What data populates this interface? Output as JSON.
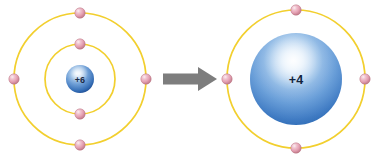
{
  "figure": {
    "type": "atomic-model-transformation-diagram",
    "background_color": "#ffffff",
    "width": 382,
    "height": 157
  },
  "palette": {
    "orbit_ring": "#f2cf2e",
    "orbit_ring_shadow": "#d9b41f",
    "electron_fill": "#e8a8b8",
    "electron_highlight": "#f7e2e8",
    "electron_edge": "#b8707f",
    "nucleus_blue_light": "#e8f2fb",
    "nucleus_blue_mid": "#5f96d4",
    "nucleus_blue_dark": "#1f5fae",
    "arrow_color": "#7d7d7d",
    "label_text": "#1b2a44"
  },
  "atoms": [
    {
      "id": "atom-left",
      "name": "carbon-atom-neutral",
      "nucleus": {
        "label": "+6",
        "charge": 6,
        "radius": 14,
        "center_x": 80,
        "center_y": 79
      },
      "shell_count": 2,
      "shells": [
        {
          "index": 1,
          "name": "inner-shell",
          "radius": 35,
          "electron_count": 2,
          "electron_angles_deg": [
            270,
            90
          ]
        },
        {
          "index": 2,
          "name": "outer-shell",
          "radius": 66,
          "electron_count": 4,
          "electron_angles_deg": [
            270,
            0,
            90,
            180
          ]
        }
      ],
      "total_electrons": 6
    },
    {
      "id": "atom-right",
      "name": "carbon-core-ion",
      "nucleus": {
        "label": "+4",
        "charge": 4,
        "radius": 46,
        "center_x": 296,
        "center_y": 79
      },
      "shell_count": 1,
      "shells": [
        {
          "index": 1,
          "name": "valence-shell",
          "radius": 69,
          "electron_count": 4,
          "electron_angles_deg": [
            270,
            0,
            90,
            180
          ]
        }
      ],
      "total_electrons": 4
    }
  ],
  "arrow": {
    "name": "transformation-arrow",
    "direction": "right",
    "color": "#7d7d7d",
    "x_start": 163,
    "x_end": 217,
    "y_center": 79,
    "shaft_height": 11,
    "head_width": 20,
    "head_height": 24,
    "label": ""
  },
  "electron_radius": 5.2,
  "captions": {
    "title": "",
    "left_caption": "",
    "right_caption": ""
  }
}
